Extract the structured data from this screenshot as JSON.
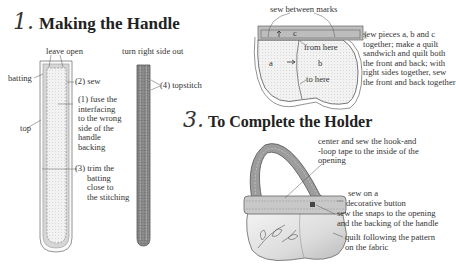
{
  "section1": {
    "number": "1.",
    "title": "Making the Handle",
    "labels": {
      "leave_open": "leave open",
      "turn_right_side_out": "turn right side out",
      "batting": "batting",
      "sew": "(2) sew",
      "top": "top",
      "topstitch": "(4) topstitch",
      "fuse": [
        "(1) fuse the",
        "interfacing",
        "to the wrong",
        "side of the",
        "handle",
        "backing"
      ],
      "trim": [
        "(3) trim the",
        "batting",
        "close to",
        "the stitching"
      ]
    }
  },
  "section2": {
    "labels": {
      "sew_between_marks": "sew between marks",
      "c": "c",
      "a": "a",
      "b": "b",
      "from_here": "from here",
      "to_here": "to here"
    },
    "instructions": [
      "sew pieces a, b and c",
      "together; make a quilt",
      "sandwich and quilt both",
      "the front and back; with",
      "right sides together, sew",
      "the front and back together"
    ]
  },
  "section3": {
    "number": "3.",
    "title": "To Complete the Holder",
    "labels": {
      "hook_loop": [
        "center and sew the hook-and",
        "-loop tape to the inside of the",
        "opening"
      ],
      "button": [
        "sew on a",
        "decorative button"
      ],
      "snaps": [
        "sew the snaps to the opening",
        "and the backing of the handle"
      ],
      "quilt": [
        "quilt following the pattern",
        "on the fabric"
      ]
    }
  },
  "colors": {
    "ink": "#333333",
    "fabric_gray": "#bdbdbd",
    "fabric_light": "#ececec",
    "strap_dark": "#8a8a8a"
  }
}
